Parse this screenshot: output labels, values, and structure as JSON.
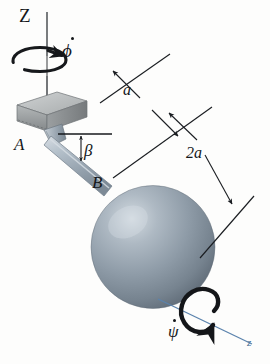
{
  "figure": {
    "type": "mechanics-diagram",
    "background_color": "#fdfdfc"
  },
  "axes": {
    "vertical_axis_label": "Z",
    "spin_axis_label": "z",
    "spin_axis_color": "#4a6f95"
  },
  "points": {
    "bracket_label": "A",
    "sphere_joint_label": "B"
  },
  "rates": {
    "precession_symbol": "ϕ",
    "precession_label": "ϕ",
    "spin_symbol": "ψ",
    "spin_label": "ψ",
    "angle_label": "β"
  },
  "dimensions": {
    "upper_label": "a",
    "lower_label": "2a"
  },
  "colors": {
    "sphere_base": "#8e9aa6",
    "sphere_highlight": "#c8d1d8",
    "sphere_shadow": "#5e6a76",
    "rod": "#aab6c0",
    "block_top": "#b9bcbd",
    "block_face": "#909496",
    "line": "#1a1d21",
    "blue_axis": "#5b83ad"
  }
}
